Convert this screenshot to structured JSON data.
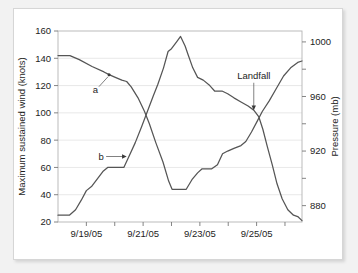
{
  "figure": {
    "background_color": "#f2f2f2",
    "card_color": "#ffffff",
    "line_color": "#555555",
    "grid_color": "#e2e2e2"
  },
  "chart_data": {
    "type": "line",
    "title": "",
    "xlabel": "",
    "ylabel": "Maximum sustained wind (knots)",
    "y2label": "Pressure (mb)",
    "grid": true,
    "legend_position": "none",
    "x_tick_labels": [
      "9/19/05",
      "9/21/05",
      "9/23/05",
      "9/25/05"
    ],
    "x_major_tick_values": [
      1,
      3,
      5,
      7
    ],
    "x_minor_tick_values": [
      0,
      2,
      4,
      6,
      8
    ],
    "xlim": [
      0,
      8.6
    ],
    "ylim": [
      20,
      160
    ],
    "y_tick_labels": [
      "20",
      "40",
      "60",
      "80",
      "100",
      "120",
      "140",
      "160"
    ],
    "y_tick_values": [
      20,
      40,
      60,
      80,
      100,
      120,
      140,
      160
    ],
    "y2lim": [
      868,
      1008
    ],
    "y2_tick_labels": [
      "880",
      "920",
      "960",
      "1000"
    ],
    "y2_tick_values": [
      880,
      920,
      960,
      1000
    ],
    "y2_minor_tick_values": [
      900,
      940,
      980,
      1000
    ],
    "series": [
      {
        "name": "Pressure (mb)",
        "label": "a",
        "axis": "right",
        "units": "mb",
        "points_left_axis": [
          [
            0.0,
            142
          ],
          [
            0.42,
            142
          ],
          [
            0.75,
            139
          ],
          [
            1.2,
            134
          ],
          [
            1.62,
            130
          ],
          [
            1.8,
            128
          ],
          [
            2.02,
            126
          ],
          [
            2.25,
            124
          ],
          [
            2.42,
            123
          ],
          [
            2.58,
            119
          ],
          [
            2.82,
            111
          ],
          [
            3.05,
            101
          ],
          [
            3.22,
            92
          ],
          [
            3.45,
            78
          ],
          [
            3.7,
            64
          ],
          [
            3.9,
            50
          ],
          [
            4.02,
            44
          ],
          [
            4.3,
            44
          ],
          [
            4.52,
            44
          ],
          [
            4.72,
            51
          ],
          [
            4.92,
            56
          ],
          [
            5.08,
            59
          ],
          [
            5.42,
            59
          ],
          [
            5.62,
            62
          ],
          [
            5.8,
            70
          ],
          [
            5.98,
            72
          ],
          [
            6.2,
            74
          ],
          [
            6.45,
            76
          ],
          [
            6.62,
            79
          ],
          [
            6.82,
            86
          ],
          [
            7.0,
            93
          ],
          [
            7.2,
            101
          ],
          [
            7.45,
            109
          ],
          [
            7.7,
            118
          ],
          [
            7.95,
            127
          ],
          [
            8.2,
            133
          ],
          [
            8.45,
            137
          ],
          [
            8.6,
            138
          ]
        ],
        "values_mb": [
          1002,
          1002,
          999,
          994,
          990,
          988,
          986,
          984,
          983,
          979,
          971,
          961,
          952,
          938,
          924,
          910,
          904,
          904,
          904,
          911,
          916,
          919,
          919,
          922,
          930,
          932,
          934,
          936,
          939,
          946,
          953,
          961,
          969,
          978,
          987,
          993,
          997,
          998
        ]
      },
      {
        "name": "Maximum sustained wind (knots)",
        "label": "b",
        "axis": "left",
        "units": "knots",
        "points_left_axis": [
          [
            0.0,
            25
          ],
          [
            0.4,
            25
          ],
          [
            0.62,
            29
          ],
          [
            0.82,
            36
          ],
          [
            1.0,
            43
          ],
          [
            1.18,
            46
          ],
          [
            1.4,
            52
          ],
          [
            1.58,
            57
          ],
          [
            1.75,
            60
          ],
          [
            2.1,
            60
          ],
          [
            2.32,
            60
          ],
          [
            2.52,
            69
          ],
          [
            2.72,
            78
          ],
          [
            2.95,
            90
          ],
          [
            3.15,
            101
          ],
          [
            3.35,
            112
          ],
          [
            3.52,
            121
          ],
          [
            3.72,
            133
          ],
          [
            3.88,
            145
          ],
          [
            4.0,
            147
          ],
          [
            4.18,
            152
          ],
          [
            4.32,
            156
          ],
          [
            4.48,
            149
          ],
          [
            4.58,
            143
          ],
          [
            4.75,
            133
          ],
          [
            4.92,
            126
          ],
          [
            5.12,
            124
          ],
          [
            5.35,
            120
          ],
          [
            5.52,
            116
          ],
          [
            5.78,
            116
          ],
          [
            5.98,
            114
          ],
          [
            6.2,
            111
          ],
          [
            6.45,
            108
          ],
          [
            6.7,
            105
          ],
          [
            6.9,
            102
          ],
          [
            7.08,
            97
          ],
          [
            7.22,
            88
          ],
          [
            7.38,
            75
          ],
          [
            7.55,
            62
          ],
          [
            7.72,
            48
          ],
          [
            7.9,
            37
          ],
          [
            8.1,
            29
          ],
          [
            8.3,
            25
          ],
          [
            8.45,
            24
          ],
          [
            8.6,
            21
          ]
        ]
      }
    ],
    "annotations": [
      {
        "text": "Landfall",
        "target_x": 6.9,
        "target_y": 102,
        "text_x": 6.9,
        "text_y": 125,
        "style": "vertical-arrow"
      },
      {
        "text": "a",
        "target_x": 1.8,
        "target_y": 128,
        "text_x": 1.32,
        "text_y": 117,
        "style": "leader-dot"
      },
      {
        "text": "b",
        "target_x": 2.42,
        "target_y": 68,
        "text_x": 1.52,
        "text_y": 68,
        "style": "horizontal-arrow"
      }
    ]
  }
}
